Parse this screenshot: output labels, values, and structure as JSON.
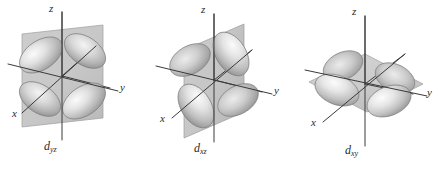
{
  "figure": {
    "background_color": "#ffffff",
    "width": 439,
    "height": 172,
    "style": "grayscale shaded 3D surface rendering with coordinate axes and nodal plane"
  },
  "palette": {
    "axis_line": "#3a3a3a",
    "label_text": "#2b2b2b",
    "plane_fill": "#b8b8b8",
    "plane_edge": "#8f8f8f",
    "lobe_light": "#f2f2f2",
    "lobe_mid": "#c9c9c9",
    "lobe_dark": "#8c8c8c",
    "lobe_outline": "#7a7a7a"
  },
  "orbitals": [
    {
      "id": "dyz",
      "label_base": "d",
      "label_sub": "yz",
      "label_full": "dyz",
      "plane": "yz",
      "plane_orientation": "vertical square plane facing viewer",
      "lobe_count": 4,
      "lobe_arrangement": "four lobes in X pattern within the yz plane",
      "axes": [
        {
          "name": "z",
          "label": "z",
          "direction": "vertical up"
        },
        {
          "name": "y",
          "label": "y",
          "direction": "right, slightly down"
        },
        {
          "name": "x",
          "label": "x",
          "direction": "lower left toward viewer"
        }
      ]
    },
    {
      "id": "dxz",
      "label_base": "d",
      "label_sub": "xz",
      "label_full": "dxz",
      "plane": "xz",
      "plane_orientation": "vertical plane seen near edge-on, receding to the right",
      "lobe_count": 4,
      "lobe_arrangement": "four lobes in X pattern within the xz plane",
      "axes": [
        {
          "name": "z",
          "label": "z",
          "direction": "vertical up"
        },
        {
          "name": "y",
          "label": "y",
          "direction": "right, slightly down"
        },
        {
          "name": "x",
          "label": "x",
          "direction": "lower left toward viewer"
        }
      ]
    },
    {
      "id": "dxy",
      "label_base": "d",
      "label_sub": "xy",
      "label_full": "dxy",
      "plane": "xy",
      "plane_orientation": "horizontal plane seen in perspective",
      "lobe_count": 4,
      "lobe_arrangement": "four lobes in X pattern within the horizontal xy plane",
      "axes": [
        {
          "name": "z",
          "label": "z",
          "direction": "vertical up"
        },
        {
          "name": "y",
          "label": "y",
          "direction": "right, slightly down"
        },
        {
          "name": "x",
          "label": "x",
          "direction": "lower left toward viewer"
        }
      ]
    }
  ]
}
